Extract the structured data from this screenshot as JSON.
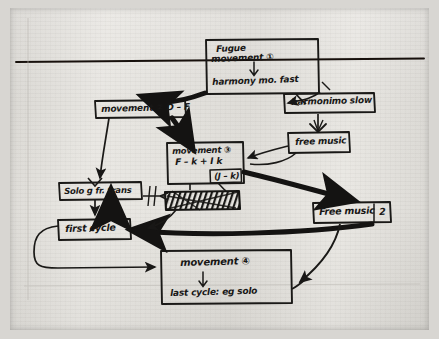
{
  "document": {
    "kind": "hand-drawn-flow-diagram",
    "medium": "black ink on lined paper",
    "subject": "Musical composition plan: fugue / movement structure",
    "paper_color": "#e7e5e0",
    "ink_color": "#181716"
  },
  "rules": [
    {
      "name": "top-horizontal-rule"
    }
  ],
  "nodes": [
    {
      "id": "fugue-movement-1",
      "lines": [
        "Fugue",
        "movement ①",
        "↓",
        "harmony mo.  fast"
      ],
      "line1": "Fugue",
      "line2": "movement ①",
      "line3": "harmony mo.  fast",
      "shape": "rectangle"
    },
    {
      "id": "movement-2",
      "lines": [
        "movement ②  D – F"
      ],
      "line1": "movement ②  D – F",
      "shape": "rectangle"
    },
    {
      "id": "harmony-slow",
      "lines": [
        "harmonimo slow"
      ],
      "line1": "harmonimo slow",
      "shape": "rectangle"
    },
    {
      "id": "free-music-1",
      "lines": [
        "free music"
      ],
      "line1": "free music",
      "shape": "rectangle"
    },
    {
      "id": "movement-3",
      "lines": [
        "movement ③",
        "F – k + I k",
        "(J – k)"
      ],
      "line1": "movement ③",
      "line2": "F – k + I k",
      "line3": "(J – k)",
      "shape": "rectangle"
    },
    {
      "id": "solo-fr-trans",
      "lines": [
        "Solo g fr. trans"
      ],
      "line1": "Solo g fr. trans",
      "shape": "rectangle"
    },
    {
      "id": "scribbled-out",
      "lines": [
        ""
      ],
      "line1": "",
      "shape": "rectangle-crossed-out",
      "note": "contents scribbled through / illegible"
    },
    {
      "id": "first-cycle",
      "lines": [
        "first cycle"
      ],
      "line1": "first cycle",
      "shape": "rectangle"
    },
    {
      "id": "free-music-2",
      "lines": [
        "Free music  2"
      ],
      "line1": "Free music",
      "line2": "2",
      "shape": "rectangle"
    },
    {
      "id": "movement-4",
      "lines": [
        "movement ④",
        "↓",
        "last cycle: eg solo"
      ],
      "line1": "movement ④",
      "line2": "last cycle: eg solo",
      "shape": "rectangle"
    }
  ],
  "edges": [
    {
      "from": "fugue-movement-1",
      "to": "movement-2",
      "weight": "thick"
    },
    {
      "from": "fugue-movement-1",
      "to": "harmony-slow",
      "weight": "thin"
    },
    {
      "from": "harmony-slow",
      "to": "free-music-1",
      "weight": "thin"
    },
    {
      "from": "movement-2",
      "to": "movement-3",
      "weight": "thick"
    },
    {
      "from": "movement-2",
      "to": "solo-fr-trans",
      "weight": "thin"
    },
    {
      "from": "free-music-1",
      "to": "movement-3",
      "weight": "thin"
    },
    {
      "from": "movement-3",
      "to": "free-music-2",
      "weight": "thick"
    },
    {
      "from": "movement-3",
      "to": "scribbled-out",
      "weight": "thin"
    },
    {
      "from": "solo-fr-trans",
      "to": "first-cycle",
      "weight": "thin"
    },
    {
      "from": "first-cycle",
      "to": "solo-fr-trans",
      "weight": "thick"
    },
    {
      "from": "free-music-2",
      "to": "first-cycle",
      "weight": "thick"
    },
    {
      "from": "first-cycle",
      "to": "movement-4",
      "weight": "thin"
    },
    {
      "from": "free-music-2",
      "to": "movement-4",
      "weight": "thin"
    }
  ]
}
